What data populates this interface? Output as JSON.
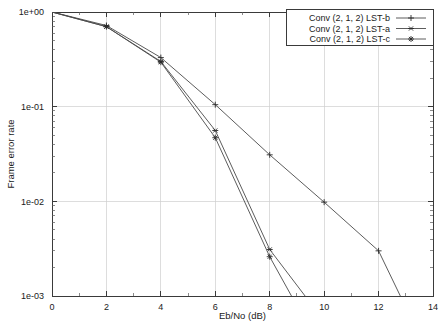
{
  "chart_data": {
    "type": "line",
    "title": "",
    "xlabel": "Eb/No (dB)",
    "ylabel": "Frame error rate",
    "xlim": [
      0,
      14
    ],
    "ylim": [
      0.001,
      1
    ],
    "yscale": "log",
    "grid": true,
    "legend_position": "top-right",
    "xticks": [
      "0",
      "2",
      "4",
      "6",
      "8",
      "10",
      "12",
      "14"
    ],
    "xtick_values": [
      0,
      2,
      4,
      6,
      8,
      10,
      12,
      14
    ],
    "yticks": [
      "1e+00",
      "1e-01",
      "1e-02",
      "1e-03"
    ],
    "ytick_values": [
      1,
      0.1,
      0.01,
      0.001
    ],
    "series": [
      {
        "name": "Conv (2, 1, 2) LST-b",
        "marker": "plus",
        "x": [
          0,
          2,
          4,
          6,
          8,
          10,
          12,
          12.8
        ],
        "values": [
          1.0,
          0.72,
          0.33,
          0.105,
          0.031,
          0.0098,
          0.003,
          0.001
        ]
      },
      {
        "name": "Conv (2, 1, 2) LST-a",
        "marker": "asterisk",
        "x": [
          0,
          2,
          4,
          6,
          8,
          9.3
        ],
        "values": [
          1.0,
          0.7,
          0.3,
          0.056,
          0.0031,
          0.001
        ]
      },
      {
        "name": "Conv (2, 1, 2) LST-c",
        "marker": "star",
        "x": [
          0,
          2,
          4,
          6,
          8,
          8.8
        ],
        "values": [
          1.0,
          0.7,
          0.295,
          0.047,
          0.0026,
          0.001
        ]
      }
    ]
  }
}
